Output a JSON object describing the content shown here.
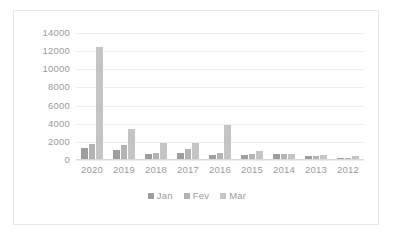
{
  "chart_data": {
    "type": "bar",
    "title": "",
    "subtitle": "",
    "xlabel": "",
    "ylabel": "",
    "categories": [
      "2020",
      "2019",
      "2018",
      "2017",
      "2016",
      "2015",
      "2014",
      "2013",
      "2012"
    ],
    "series": [
      {
        "name": "Jan",
        "color": "#9e9e9e",
        "values": [
          1200,
          1000,
          600,
          650,
          400,
          450,
          500,
          350,
          120
        ]
      },
      {
        "name": "Fev",
        "color": "#b3b3b3",
        "values": [
          1700,
          1600,
          700,
          1050,
          650,
          500,
          500,
          300,
          150
        ]
      },
      {
        "name": "Mar",
        "color": "#c4c4c4",
        "values": [
          12400,
          3300,
          1750,
          1750,
          3800,
          900,
          600,
          420,
          330
        ]
      }
    ],
    "ylim": [
      0,
      14000
    ],
    "ytick_values": [
      0,
      2000,
      4000,
      6000,
      8000,
      10000,
      12000,
      14000
    ],
    "ytick_labels": [
      "0",
      "2000",
      "4000",
      "6000",
      "8000",
      "10000",
      "12000",
      "14000"
    ],
    "grid": {
      "horizontal": true,
      "vertical": false,
      "color": "#ededed"
    },
    "legend": {
      "position": "bottom",
      "orientation": "horizontal",
      "entries": [
        "Jan",
        "Fev",
        "Mar"
      ]
    },
    "axis_label_color": "#9a9a9a",
    "plot_background": "#ffffff",
    "frame_border_color": "#e8e8e8"
  }
}
